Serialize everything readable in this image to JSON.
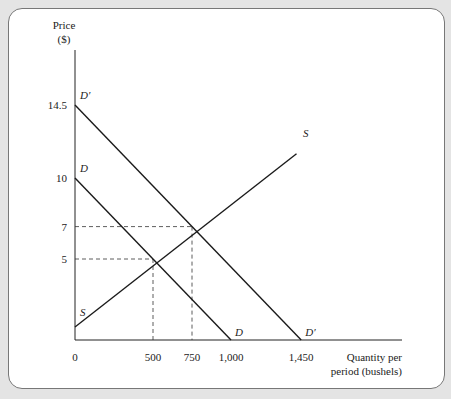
{
  "chart_data": {
    "type": "line",
    "title": "",
    "ylabel": "Price ($)",
    "ylabel_lines": [
      "Price",
      "($)"
    ],
    "xlabel": "Quantity per period (bushels)",
    "xlabel_lines": [
      "Quantity per",
      "period (bushels)"
    ],
    "xlim": [
      0,
      1800
    ],
    "ylim": [
      0,
      19
    ],
    "x_ticks": [
      {
        "v": 0,
        "label": "0"
      },
      {
        "v": 500,
        "label": "500"
      },
      {
        "v": 750,
        "label": "750"
      },
      {
        "v": 1000,
        "label": "1,000"
      },
      {
        "v": 1450,
        "label": "1,450"
      }
    ],
    "y_ticks": [
      {
        "v": 5,
        "label": "5"
      },
      {
        "v": 7,
        "label": "7"
      },
      {
        "v": 10,
        "label": "10"
      },
      {
        "v": 14.5,
        "label": "14.5"
      }
    ],
    "grid": false,
    "series": [
      {
        "name": "D",
        "points": [
          [
            0,
            10
          ],
          [
            1000,
            0
          ]
        ],
        "label_start": "D",
        "label_end": "D"
      },
      {
        "name": "D′",
        "points": [
          [
            0,
            14.5
          ],
          [
            1450,
            0
          ]
        ],
        "label_start": "D′",
        "label_end": "D′"
      },
      {
        "name": "S",
        "points": [
          [
            0,
            0.8
          ],
          [
            1420,
            11.5
          ]
        ],
        "label_start": "S",
        "label_end": "S"
      }
    ],
    "equilibria": [
      {
        "q": 500,
        "p": 5,
        "curves": [
          "D",
          "S"
        ]
      },
      {
        "q": 750,
        "p": 7,
        "curves": [
          "D′",
          "S"
        ]
      }
    ]
  }
}
